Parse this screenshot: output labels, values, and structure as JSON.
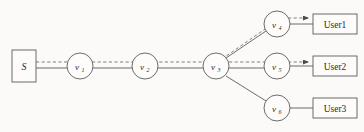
{
  "figure": {
    "type": "network-topology-diagram",
    "background_color": "#fbfaf8",
    "stroke_color": "#5c5c5c",
    "width": 364,
    "height": 132
  },
  "source": {
    "id": "S",
    "label": "S",
    "shape": "rectangle",
    "x": 12,
    "y": 50,
    "w": 24,
    "h": 32
  },
  "nodes": [
    {
      "id": "v1",
      "label": "v",
      "subscript": "1",
      "cx": 80,
      "cy": 66,
      "r": 13
    },
    {
      "id": "v2",
      "label": "v",
      "subscript": "2",
      "cx": 145,
      "cy": 66,
      "r": 13
    },
    {
      "id": "v3",
      "label": "v",
      "subscript": "3",
      "cx": 216,
      "cy": 66,
      "r": 13
    },
    {
      "id": "v4",
      "label": "v",
      "subscript": "4",
      "cx": 277,
      "cy": 24,
      "r": 13
    },
    {
      "id": "v5",
      "label": "v",
      "subscript": "5",
      "cx": 277,
      "cy": 66,
      "r": 13
    },
    {
      "id": "v6",
      "label": "v",
      "subscript": "6",
      "cx": 277,
      "cy": 108,
      "r": 13
    }
  ],
  "users": [
    {
      "id": "user1",
      "label": "User1",
      "x": 313,
      "y": 12,
      "w": 44,
      "h": 20
    },
    {
      "id": "user2",
      "label": "User2",
      "x": 313,
      "y": 56,
      "w": 44,
      "h": 20
    },
    {
      "id": "user3",
      "label": "User3",
      "x": 313,
      "y": 98,
      "w": 44,
      "h": 20
    }
  ],
  "links": [
    {
      "id": "s-v1",
      "from": "S",
      "to": "v1",
      "style": "solid",
      "arrow": false
    },
    {
      "id": "v1-v2",
      "from": "v1",
      "to": "v2",
      "style": "solid",
      "arrow": false
    },
    {
      "id": "v2-v3",
      "from": "v2",
      "to": "v3",
      "style": "solid",
      "arrow": false
    },
    {
      "id": "v3-v4",
      "from": "v3",
      "to": "v4",
      "style": "solid-dashed",
      "arrow": false
    },
    {
      "id": "v3-v5",
      "from": "v3",
      "to": "v5",
      "style": "solid-dashed",
      "arrow": false
    },
    {
      "id": "v3-v6",
      "from": "v3",
      "to": "v6",
      "style": "solid",
      "arrow": false
    },
    {
      "id": "v4-user1",
      "from": "v4",
      "to": "user1",
      "style": "solid",
      "arrow": false
    },
    {
      "id": "v5-user2",
      "from": "v5",
      "to": "user2",
      "style": "solid",
      "arrow": false
    },
    {
      "id": "v6-user3",
      "from": "v6",
      "to": "user3",
      "style": "solid",
      "arrow": false
    }
  ],
  "flow_path": {
    "description": "dashed multicast flow overlay from source through relays to users",
    "style": "dashed",
    "arrowheads": 2,
    "targets": [
      "user1",
      "user2"
    ]
  }
}
